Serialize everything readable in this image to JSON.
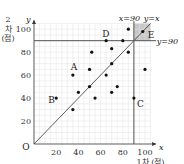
{
  "chart_data": {
    "type": "scatter",
    "title": "",
    "xlabel": "1차 (점)",
    "ylabel": "2차 (점)",
    "x_axis_symbol": "x",
    "y_axis_symbol": "y",
    "origin_label": "O",
    "xlim": [
      0,
      100
    ],
    "ylim": [
      0,
      100
    ],
    "x_ticks": [
      20,
      40,
      60,
      80,
      100
    ],
    "y_ticks": [
      20,
      40,
      60,
      80,
      100
    ],
    "grid": true,
    "points": [
      {
        "x": 85,
        "y": 100
      },
      {
        "x": 98,
        "y": 98,
        "label": "E"
      },
      {
        "x": 65,
        "y": 90,
        "label": "D"
      },
      {
        "x": 80,
        "y": 90
      },
      {
        "x": 52,
        "y": 80
      },
      {
        "x": 70,
        "y": 83
      },
      {
        "x": 85,
        "y": 80
      },
      {
        "x": 70,
        "y": 70
      },
      {
        "x": 35,
        "y": 60,
        "label": "A"
      },
      {
        "x": 50,
        "y": 65
      },
      {
        "x": 65,
        "y": 60
      },
      {
        "x": 100,
        "y": 65
      },
      {
        "x": 40,
        "y": 45
      },
      {
        "x": 50,
        "y": 50
      },
      {
        "x": 75,
        "y": 50
      },
      {
        "x": 70,
        "y": 45
      },
      {
        "x": 55,
        "y": 40
      },
      {
        "x": 20,
        "y": 40,
        "label": "B"
      },
      {
        "x": 35,
        "y": 30
      },
      {
        "x": 90,
        "y": 40,
        "label": "C"
      }
    ],
    "annotations": [
      {
        "type": "line",
        "label": "y=x"
      },
      {
        "type": "vline",
        "x": 90,
        "label": "x=90"
      },
      {
        "type": "hline",
        "y": 90,
        "label": "y=90"
      },
      {
        "type": "shaded_region",
        "x": [
          90,
          100
        ],
        "y": [
          90,
          100
        ]
      }
    ]
  }
}
